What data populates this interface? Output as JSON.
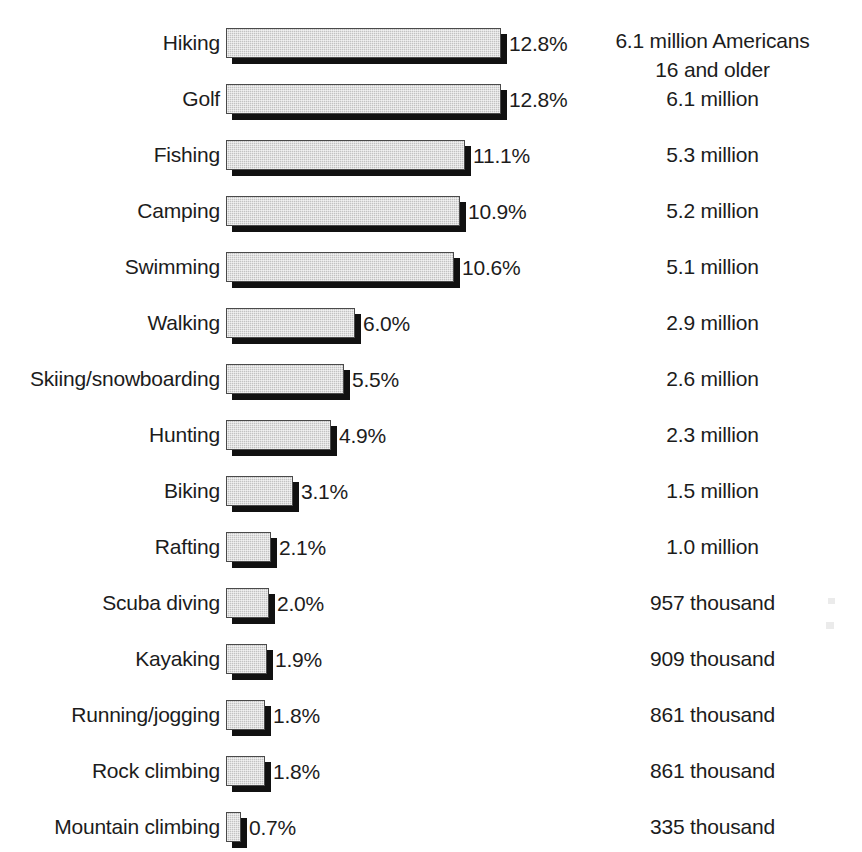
{
  "chart_data": {
    "type": "bar",
    "orientation": "horizontal",
    "title": "",
    "subtitle": "",
    "xlabel": "",
    "ylabel": "",
    "grid": false,
    "legend": null,
    "xlim": [
      0,
      12.8
    ],
    "value_suffix": "%",
    "categories": [
      "Hiking",
      "Golf",
      "Fishing",
      "Camping",
      "Swimming",
      "Walking",
      "Skiing/snowboarding",
      "Hunting",
      "Biking",
      "Rafting",
      "Scuba diving",
      "Kayaking",
      "Running/jogging",
      "Rock climbing",
      "Mountain climbing"
    ],
    "values": [
      12.8,
      12.8,
      11.1,
      10.9,
      10.6,
      6.0,
      5.5,
      4.9,
      3.1,
      2.1,
      2.0,
      1.9,
      1.8,
      1.8,
      0.7
    ],
    "value_labels": [
      "12.8%",
      "12.8%",
      "11.1%",
      "10.9%",
      "10.6%",
      "6.0%",
      "5.5%",
      "4.9%",
      "3.1%",
      "2.1%",
      "2.0%",
      "1.9%",
      "1.8%",
      "1.8%",
      "0.7%"
    ],
    "annotations": [
      "6.1 million Americans\n16 and older",
      "6.1 million",
      "5.3 million",
      "5.2 million",
      "5.1 million",
      "2.9 million",
      "2.6 million",
      "2.3 million",
      "1.5 million",
      "1.0 million",
      "957 thousand",
      "909 thousand",
      "861 thousand",
      "861 thousand",
      "335 thousand"
    ],
    "annotation_column_header": "6.1 million Americans 16 and older"
  },
  "style": {
    "bar_fill_color": "#c2c2c2",
    "bar_border_color": "#4a4a4a",
    "bar_shadow_color": "#111111",
    "text_color": "#1c1c1c",
    "background_color": "#ffffff"
  },
  "layout": {
    "px_per_percent": 21.5,
    "bar_origin_x": 226,
    "row_pitch": 56,
    "first_row_top": 28,
    "bar_height": 30,
    "shadow_offset": 6
  }
}
